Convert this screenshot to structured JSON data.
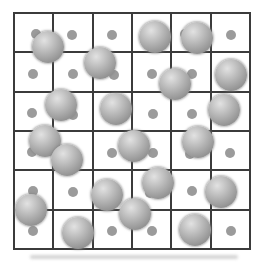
{
  "figure": {
    "background_color": "#ffffff",
    "grid": {
      "rows": 6,
      "cols": 6,
      "x": 14,
      "y": 13,
      "width": 236,
      "height": 236,
      "line_color": "#3b3b3b",
      "line_width": 2
    },
    "small_atoms": {
      "diameter": 10,
      "color": "#9b9b9b",
      "positions": [
        {
          "x": 36,
          "y": 34
        },
        {
          "x": 72,
          "y": 35
        },
        {
          "x": 112,
          "y": 35
        },
        {
          "x": 185,
          "y": 34
        },
        {
          "x": 231,
          "y": 35
        },
        {
          "x": 33,
          "y": 74
        },
        {
          "x": 73,
          "y": 74
        },
        {
          "x": 114,
          "y": 75
        },
        {
          "x": 152,
          "y": 74
        },
        {
          "x": 192,
          "y": 74
        },
        {
          "x": 32,
          "y": 113
        },
        {
          "x": 73,
          "y": 115
        },
        {
          "x": 153,
          "y": 114
        },
        {
          "x": 192,
          "y": 114
        },
        {
          "x": 32,
          "y": 152
        },
        {
          "x": 112,
          "y": 153
        },
        {
          "x": 153,
          "y": 153
        },
        {
          "x": 190,
          "y": 154
        },
        {
          "x": 230,
          "y": 153
        },
        {
          "x": 33,
          "y": 191
        },
        {
          "x": 73,
          "y": 192
        },
        {
          "x": 150,
          "y": 193
        },
        {
          "x": 192,
          "y": 191
        },
        {
          "x": 33,
          "y": 231
        },
        {
          "x": 112,
          "y": 231
        },
        {
          "x": 152,
          "y": 231
        },
        {
          "x": 231,
          "y": 231
        }
      ]
    },
    "large_atoms": {
      "diameter": 32,
      "color_highlight": "#e2e2e2",
      "color_mid": "#b2b2b2",
      "color_edge": "#858585",
      "halo_color": "rgba(125,125,125,0.55)",
      "positions": [
        {
          "x": 48,
          "y": 47
        },
        {
          "x": 155,
          "y": 37
        },
        {
          "x": 197,
          "y": 38
        },
        {
          "x": 100,
          "y": 63
        },
        {
          "x": 175,
          "y": 84
        },
        {
          "x": 231,
          "y": 75
        },
        {
          "x": 61,
          "y": 105
        },
        {
          "x": 116,
          "y": 109
        },
        {
          "x": 224,
          "y": 110
        },
        {
          "x": 45,
          "y": 141
        },
        {
          "x": 67,
          "y": 160
        },
        {
          "x": 134,
          "y": 146
        },
        {
          "x": 198,
          "y": 142
        },
        {
          "x": 31,
          "y": 210
        },
        {
          "x": 107,
          "y": 195
        },
        {
          "x": 158,
          "y": 183
        },
        {
          "x": 221,
          "y": 192
        },
        {
          "x": 135,
          "y": 214
        },
        {
          "x": 78,
          "y": 233
        },
        {
          "x": 195,
          "y": 230
        }
      ]
    },
    "scan_smudge": {
      "x": 30,
      "y": 255,
      "width": 208,
      "height": 4,
      "color": "rgba(160,160,160,0.45)"
    }
  }
}
